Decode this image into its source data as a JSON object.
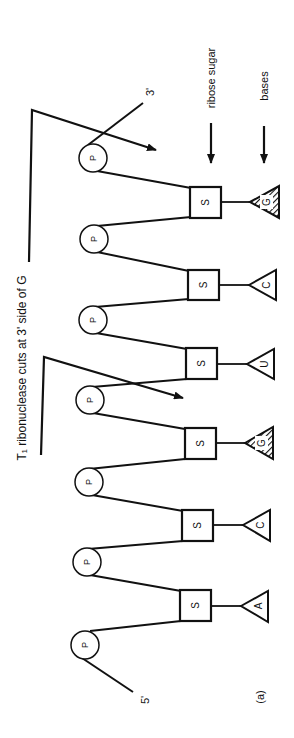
{
  "figure": {
    "panel_label": "(a)",
    "five_prime_label": "5'",
    "three_prime_label": "3'",
    "cut_annotation": "T₁ ribonuclease cuts at 3' side of G",
    "legend": {
      "ribose_label": "ribose sugar",
      "bases_label": "bases"
    },
    "phosphate_label": "P",
    "sugar_label": "S",
    "nucleotides": [
      {
        "base": "A",
        "cleavage_site": false
      },
      {
        "base": "C",
        "cleavage_site": false
      },
      {
        "base": "G",
        "cleavage_site": true
      },
      {
        "base": "U",
        "cleavage_site": false
      },
      {
        "base": "C",
        "cleavage_site": false
      },
      {
        "base": "G",
        "cleavage_site": true
      }
    ],
    "colors": {
      "ink": "#111111",
      "background": "#ffffff"
    }
  }
}
